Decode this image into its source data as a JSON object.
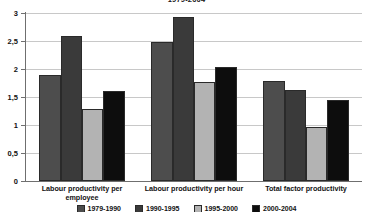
{
  "chart_data": {
    "type": "bar",
    "title": "1979-2004",
    "xlabel": "",
    "ylabel": "",
    "ylim": [
      0,
      3
    ],
    "ytick_labels": [
      "3",
      "2,5",
      "2",
      "1,5",
      "1",
      "0,5",
      "0"
    ],
    "ytick_values": [
      3,
      2.5,
      2,
      1.5,
      1,
      0.5,
      0
    ],
    "grid": true,
    "legend_position": "bottom",
    "categories": [
      "Labour productivity per employee",
      "Labour productivity per hour",
      "Total factor productivity"
    ],
    "series": [
      {
        "name": "1979-1990",
        "color": "#4d4d4d",
        "values": [
          1.9,
          2.48,
          1.79
        ]
      },
      {
        "name": "1990-1995",
        "color": "#3a3a3a",
        "values": [
          2.59,
          2.92,
          1.62
        ]
      },
      {
        "name": "1995-2000",
        "color": "#b3b3b3",
        "values": [
          1.29,
          1.76,
          0.96
        ]
      },
      {
        "name": "2000-2004",
        "color": "#0d0d0d",
        "values": [
          1.61,
          2.04,
          1.44
        ]
      }
    ]
  }
}
